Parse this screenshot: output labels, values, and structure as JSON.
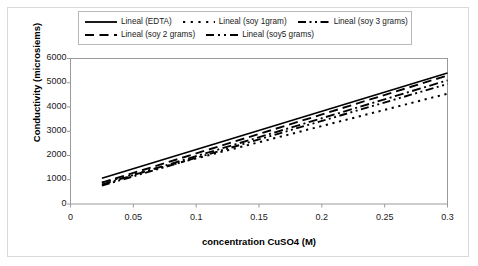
{
  "chart_data": {
    "type": "line",
    "title": "",
    "xlabel": "concentration CuSO4 (M)",
    "ylabel": "Conductivity (microsiems)",
    "xlim": [
      0,
      0.3
    ],
    "ylim": [
      0,
      6000
    ],
    "xticks": [
      "0",
      "0.05",
      "0.1",
      "0.15",
      "0.2",
      "0.25",
      "0.3"
    ],
    "xtick_values": [
      0,
      0.05,
      0.1,
      0.15,
      0.2,
      0.25,
      0.3
    ],
    "yticks": [
      "0",
      "1000",
      "2000",
      "3000",
      "4000",
      "5000",
      "6000"
    ],
    "ytick_values": [
      0,
      1000,
      2000,
      3000,
      4000,
      5000,
      6000
    ],
    "grid": false,
    "legend_position": "top",
    "x": [
      0.025,
      0.3
    ],
    "series": [
      {
        "name": "Lineal (EDTA)",
        "style": "solid",
        "color": "#000000",
        "values": [
          1060,
          5400
        ]
      },
      {
        "name": "Lineal (soy 1gram)",
        "style": "dotted",
        "color": "#000000",
        "values": [
          880,
          4550
        ]
      },
      {
        "name": "Lineal (soy 3 grams)",
        "style": "dash-dot",
        "color": "#000000",
        "values": [
          800,
          5100
        ]
      },
      {
        "name": "Lineal (soy 2 grams)",
        "style": "dashed",
        "color": "#000000",
        "values": [
          880,
          5300
        ]
      },
      {
        "name": "Lineal (soy5 grams)",
        "style": "dash-dot-dot",
        "color": "#000000",
        "values": [
          760,
          4950
        ]
      }
    ]
  },
  "legend": {
    "row1": [
      {
        "label": "Lineal (EDTA)",
        "style": "solid"
      },
      {
        "label": "Lineal (soy 1gram)",
        "style": "dotted"
      },
      {
        "label": "Lineal (soy 3 grams)",
        "style": "dash-dot"
      }
    ],
    "row2": [
      {
        "label": "Lineal (soy 2 grams)",
        "style": "dashed"
      },
      {
        "label": "Lineal (soy5 grams)",
        "style": "dash-dot-dot"
      }
    ]
  },
  "axes": {
    "y_title": "Conductivity (microsiems)",
    "x_title": "concentration CuSO4 (M)",
    "y_labels": [
      "6000",
      "5000",
      "4000",
      "3000",
      "2000",
      "1000",
      "0"
    ],
    "x_labels": [
      "0",
      "0.05",
      "0.1",
      "0.15",
      "0.2",
      "0.25",
      "0.3"
    ]
  }
}
